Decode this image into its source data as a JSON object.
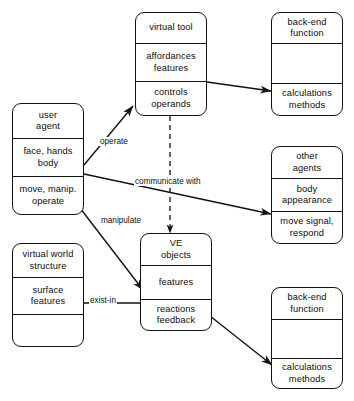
{
  "diagram": {
    "type": "uml-class-diagram",
    "line_color": "#121212",
    "background_color": "#ffffff",
    "boxes": [
      {
        "id": "virtual-tool",
        "name": "virtual tool",
        "compartments": [
          {
            "lines": [
              "virtual tool"
            ]
          },
          {
            "lines": [
              "affordances",
              "features"
            ]
          },
          {
            "lines": [
              "controls",
              "operands"
            ]
          }
        ]
      },
      {
        "id": "back-end-function-top",
        "name": "back-end function",
        "compartments": [
          {
            "lines": [
              "back-end",
              "function"
            ]
          },
          {
            "lines": []
          },
          {
            "lines": [
              "calculations",
              "methods"
            ]
          }
        ]
      },
      {
        "id": "user-agent",
        "name": "user agent",
        "compartments": [
          {
            "lines": [
              "user",
              "agent"
            ]
          },
          {
            "lines": [
              "face, hands",
              "body"
            ]
          },
          {
            "lines": [
              "move, manip.",
              "operate"
            ]
          }
        ]
      },
      {
        "id": "other-agents",
        "name": "other agents",
        "compartments": [
          {
            "lines": [
              "other",
              "agents"
            ]
          },
          {
            "lines": [
              "body",
              "appearance"
            ]
          },
          {
            "lines": [
              "move signal,",
              "respond"
            ]
          }
        ]
      },
      {
        "id": "virtual-world-structure",
        "name": "virtual world structure",
        "compartments": [
          {
            "lines": [
              "virtual  world",
              "structure"
            ]
          },
          {
            "lines": [
              "surface",
              "features"
            ]
          },
          {
            "lines": []
          }
        ]
      },
      {
        "id": "ve-objects",
        "name": "VE objects",
        "compartments": [
          {
            "lines": [
              "VE",
              "objects"
            ]
          },
          {
            "lines": [
              "features"
            ]
          },
          {
            "lines": [
              "reactions",
              "feedback"
            ]
          }
        ]
      },
      {
        "id": "back-end-function-bottom",
        "name": "back-end function",
        "compartments": [
          {
            "lines": [
              "back-end",
              "function"
            ]
          },
          {
            "lines": []
          },
          {
            "lines": [
              "calculations",
              "methods"
            ]
          }
        ]
      }
    ],
    "edges": [
      {
        "id": "operate",
        "label": "operate",
        "from": "user-agent",
        "to": "virtual-tool",
        "style": "solid",
        "arrows": "single"
      },
      {
        "id": "tool-backend",
        "label": "",
        "from": "virtual-tool",
        "to": "back-end-function-top",
        "style": "solid",
        "arrows": "double"
      },
      {
        "id": "communicate-with",
        "label": "communicate with",
        "from": "user-agent",
        "to": "other-agents",
        "style": "solid",
        "arrows": "double"
      },
      {
        "id": "tool-ve-dependency",
        "label": "",
        "from": "virtual-tool",
        "to": "ve-objects",
        "style": "dashed",
        "arrows": "single"
      },
      {
        "id": "manipulate",
        "label": "manipulate",
        "from": "user-agent",
        "to": "ve-objects",
        "style": "solid",
        "arrows": "single"
      },
      {
        "id": "exist-in",
        "label": "exist-in",
        "from": "virtual-world-structure",
        "to": "ve-objects",
        "style": "solid",
        "arrows": "none"
      },
      {
        "id": "ve-backend",
        "label": "",
        "from": "ve-objects",
        "to": "back-end-function-bottom",
        "style": "solid",
        "arrows": "double"
      }
    ]
  }
}
